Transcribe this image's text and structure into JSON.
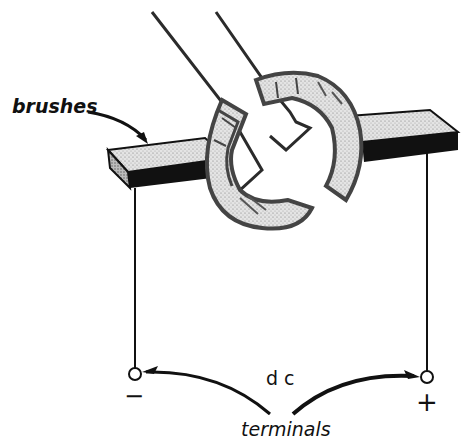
{
  "diagram": {
    "labels": {
      "brushes": "brushes",
      "dc": "d c",
      "terminals": "terminals",
      "negative": "−",
      "positive": "+"
    },
    "colors": {
      "ink": "#111111",
      "segment_gray": "#4a4a4a",
      "stipple": "#d9d9d9",
      "background": "#ffffff"
    },
    "components": [
      {
        "id": "left-brush",
        "type": "brush"
      },
      {
        "id": "right-brush",
        "type": "brush"
      },
      {
        "id": "commutator-segment-left",
        "type": "split-ring-segment"
      },
      {
        "id": "commutator-segment-right",
        "type": "split-ring-segment"
      },
      {
        "id": "coil-wire-left",
        "type": "wire"
      },
      {
        "id": "coil-wire-right",
        "type": "wire"
      },
      {
        "id": "negative-terminal",
        "type": "terminal",
        "polarity": "−"
      },
      {
        "id": "positive-terminal",
        "type": "terminal",
        "polarity": "+"
      }
    ]
  }
}
